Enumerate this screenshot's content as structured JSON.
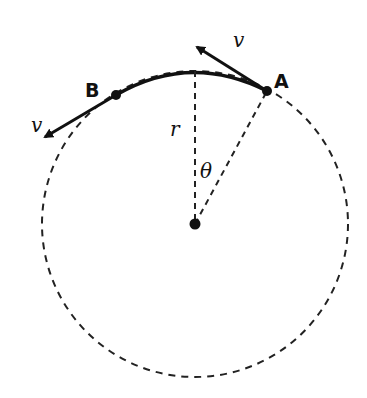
{
  "diagram": {
    "colors": {
      "stroke": "#111111",
      "background": "#ffffff"
    },
    "center": {
      "x": 195,
      "y": 224
    },
    "radius": 153,
    "points": [
      {
        "id": "A",
        "label": "A",
        "x": 267,
        "y": 91
      },
      {
        "id": "B",
        "label": "B",
        "x": 116,
        "y": 95
      }
    ],
    "velocity_labels": {
      "at_A": "v",
      "at_B": "v"
    },
    "radius_label": "r",
    "angle_label": "θ"
  }
}
